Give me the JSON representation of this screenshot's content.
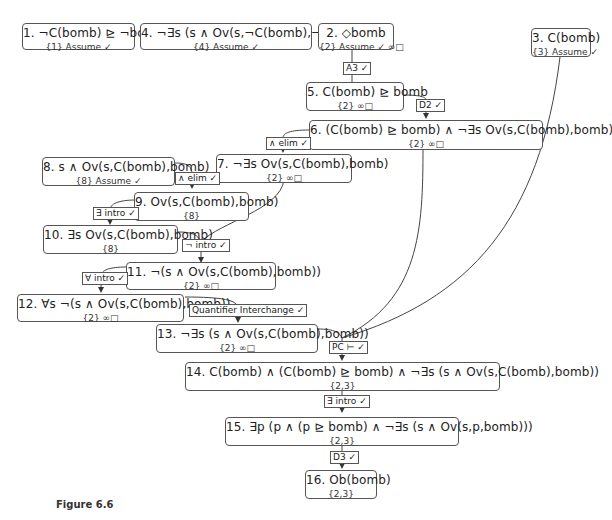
{
  "figure": {
    "caption": "Figure 6.6",
    "nodes": [
      {
        "id": "n1",
        "formula": "1. ¬C(bomb) ⊵ ¬bomb",
        "deps": "{1} Assume ✓"
      },
      {
        "id": "n4",
        "formula": "4. ¬∃s (s ∧ Ov(s,¬C(bomb),¬bomb))",
        "deps": "{4} Assume ✓"
      },
      {
        "id": "n2",
        "formula": "2. ◇bomb",
        "deps": "{2} Assume ✓ ∞□"
      },
      {
        "id": "n3",
        "formula": "3. C(bomb)",
        "deps": "{3} Assume ✓"
      },
      {
        "id": "n5",
        "formula": "5. C(bomb) ⊵ bomb",
        "deps": "{2} ∞□"
      },
      {
        "id": "n6",
        "formula": "6. (C(bomb) ⊵ bomb) ∧ ¬∃s Ov(s,C(bomb),bomb)",
        "deps": "{2} ∞□"
      },
      {
        "id": "n7",
        "formula": "7. ¬∃s Ov(s,C(bomb),bomb)",
        "deps": "{2} ∞□"
      },
      {
        "id": "n8",
        "formula": "8. s ∧ Ov(s,C(bomb),bomb)",
        "deps": "{8} Assume ✓"
      },
      {
        "id": "n9",
        "formula": "9. Ov(s,C(bomb),bomb)",
        "deps": "{8}"
      },
      {
        "id": "n10",
        "formula": "10. ∃s Ov(s,C(bomb),bomb)",
        "deps": "{8}"
      },
      {
        "id": "n11",
        "formula": "11. ¬(s ∧ Ov(s,C(bomb),bomb))",
        "deps": "{2} ∞□"
      },
      {
        "id": "n12",
        "formula": "12. ∀s ¬(s ∧ Ov(s,C(bomb),bomb))",
        "deps": "{2} ∞□"
      },
      {
        "id": "n13",
        "formula": "13. ¬∃s (s ∧ Ov(s,C(bomb),bomb))",
        "deps": "{2} ∞□"
      },
      {
        "id": "n14",
        "formula": "14. C(bomb) ∧ (C(bomb) ⊵ bomb) ∧ ¬∃s (s ∧ Ov(s,C(bomb),bomb))",
        "deps": "{2,3}"
      },
      {
        "id": "n15",
        "formula": "15. ∃p (p ∧ (p ⊵ bomb) ∧ ¬∃s (s ∧ Ov(s,p,bomb)))",
        "deps": "{2,3}"
      },
      {
        "id": "n16",
        "formula": "16. Ob(bomb)",
        "deps": "{2,3}"
      }
    ],
    "rules": [
      {
        "id": "r_a3",
        "label": "A3 ✓"
      },
      {
        "id": "r_d2",
        "label": "D2 ✓"
      },
      {
        "id": "r_and_elim_1",
        "label": "∧ elim ✓"
      },
      {
        "id": "r_and_elim_2",
        "label": "∧ elim ✓"
      },
      {
        "id": "r_exists_intro_1",
        "label": "∃ intro ✓"
      },
      {
        "id": "r_neg_intro",
        "label": "¬ intro ✓"
      },
      {
        "id": "r_forall_intro",
        "label": "∀ intro ✓"
      },
      {
        "id": "r_quant_interchange",
        "label": "Quantifier Interchange ✓"
      },
      {
        "id": "r_pc",
        "label": "PC ⊢ ✓"
      },
      {
        "id": "r_exists_intro_2",
        "label": "∃ intro ✓"
      },
      {
        "id": "r_d3",
        "label": "D3 ✓"
      }
    ],
    "edges": [
      {
        "from": "n2",
        "to": "n5",
        "rule": "A3 ✓"
      },
      {
        "from": "n5",
        "to": "n6",
        "rule": "D2 ✓"
      },
      {
        "from": "n6",
        "to": "n7",
        "rule": "∧ elim ✓"
      },
      {
        "from": "n8",
        "to": "n9",
        "rule": "∧ elim ✓"
      },
      {
        "from": "n9",
        "to": "n10",
        "rule": "∃ intro ✓"
      },
      {
        "from": "n10",
        "to": "n11",
        "rule": "¬ intro ✓"
      },
      {
        "from": "n7",
        "to": "n11",
        "rule": "¬ intro ✓"
      },
      {
        "from": "n11",
        "to": "n12",
        "rule": "∀ intro ✓"
      },
      {
        "from": "n12",
        "to": "n13",
        "rule": "Quantifier Interchange ✓"
      },
      {
        "from": "n13",
        "to": "n14",
        "rule": "PC ⊢ ✓"
      },
      {
        "from": "n6",
        "to": "n14",
        "rule": "PC ⊢ ✓"
      },
      {
        "from": "n3",
        "to": "n14",
        "rule": "PC ⊢ ✓"
      },
      {
        "from": "n14",
        "to": "n15",
        "rule": "∃ intro ✓"
      },
      {
        "from": "n15",
        "to": "n16",
        "rule": "D3 ✓"
      }
    ]
  }
}
